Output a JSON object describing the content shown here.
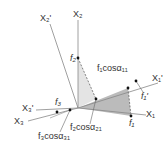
{
  "diagram": {
    "type": "coordinate-rotation",
    "labels": {
      "x1": "X₁",
      "x2": "X₂",
      "x3": "X₃",
      "x1p": "X₁'",
      "x2p": "X₂'",
      "x3p": "X₃'",
      "f1": "f₁",
      "f2": "f₂",
      "f3": "f₃",
      "f1p": "f₁'",
      "f1cos11": "f₁cosα₁₁",
      "f2cos21": "f₂cosα₂₁",
      "f3cos31": "f₃cosα₃₁"
    },
    "colors": {
      "axis": "#888888",
      "dark_fill": "#bbbbbb",
      "light_fill": "#e4e4e4",
      "point": "#111111"
    }
  }
}
